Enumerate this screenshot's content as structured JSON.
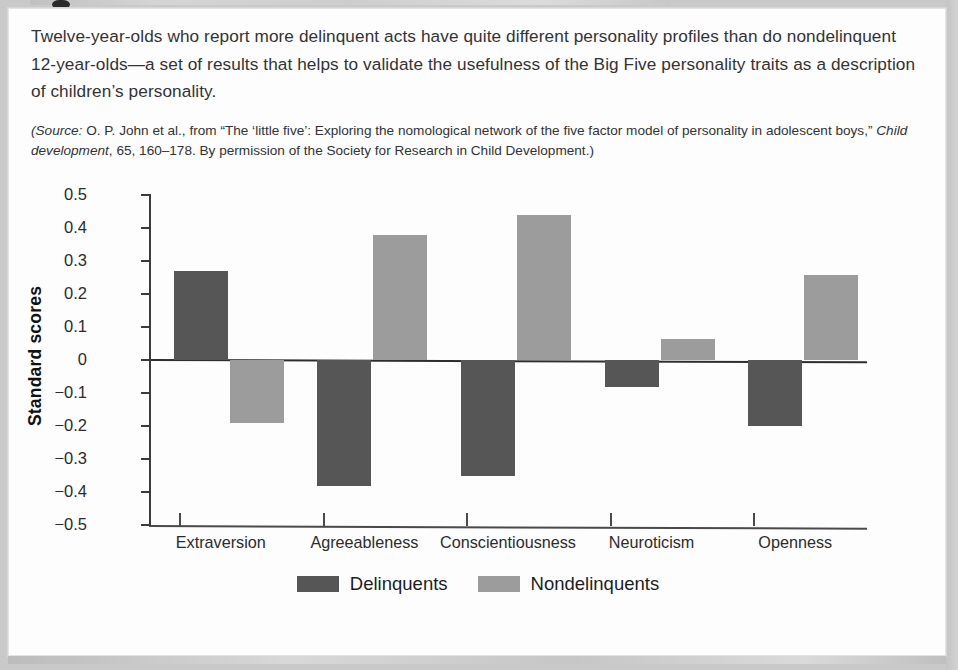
{
  "caption": {
    "body": "Twelve-year-olds who report more delinquent acts have quite different personality profiles than do nondelinquent 12-year-olds—a set of results that helps to validate the usefulness of the Big Five personality traits as a description of children’s personality.",
    "source_prefix": "(Source:",
    "source_rest_1": " O. P. John et al., from “The ‘little five’: Exploring the nomological network of the five factor model of personality in adolescent boys,” ",
    "source_journal": "Child development",
    "source_rest_2": ", 65, 160–178. By permission of the Society for Research in Child Development.)"
  },
  "chart_data": {
    "type": "bar",
    "title": "",
    "xlabel": "",
    "ylabel": "Standard scores",
    "categories": [
      "Extraversion",
      "Agreeableness",
      "Conscientiousness",
      "Neuroticism",
      "Openness"
    ],
    "series": [
      {
        "name": "Delinquents",
        "color": "#565656",
        "values": [
          0.27,
          -0.38,
          -0.35,
          -0.08,
          -0.2
        ]
      },
      {
        "name": "Nondelinquents",
        "color": "#9c9c9c",
        "values": [
          -0.19,
          0.38,
          0.44,
          0.065,
          0.26
        ]
      }
    ],
    "ylim": [
      -0.5,
      0.5
    ],
    "yticks": [
      0.5,
      0.4,
      0.3,
      0.2,
      0.1,
      0,
      -0.1,
      -0.2,
      -0.3,
      -0.4,
      -0.5
    ],
    "ytick_labels": [
      "0.5",
      "0.4",
      "0.3",
      "0.2",
      "0.1",
      "0",
      "−0.1",
      "−0.2",
      "−0.3",
      "−0.4",
      "−0.5"
    ],
    "grid": false,
    "zero_line": true,
    "legend_position": "bottom",
    "legend_entries": [
      "Delinquents",
      "Nondelinquents"
    ]
  }
}
